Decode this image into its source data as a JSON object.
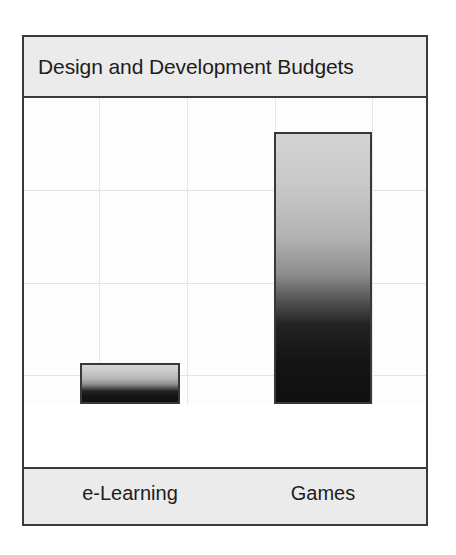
{
  "chart": {
    "title": "Design and Development Budgets",
    "colors": {
      "frame_border": "#3a3a3a",
      "band_background": "#ebebeb",
      "plot_background": "#fdfdfd",
      "gridline": "#e2e2e2",
      "bar_border": "#383838",
      "bar_gradient_top": "#d4d4d4",
      "bar_gradient_bottom": "#101010",
      "text": "#1d1d1d"
    }
  },
  "chart_data": {
    "type": "bar",
    "title": "Design and Development Budgets",
    "xlabel": "",
    "ylabel": "",
    "categories": [
      "e-Learning",
      "Games"
    ],
    "values": [
      13.5,
      89
    ],
    "ylim": [
      0,
      100
    ],
    "grid": true,
    "gridlines_y": [
      25,
      50,
      75
    ],
    "legend": "none",
    "series": [
      {
        "name": "Budget",
        "values": [
          13.5,
          89
        ]
      }
    ],
    "annotations": []
  }
}
